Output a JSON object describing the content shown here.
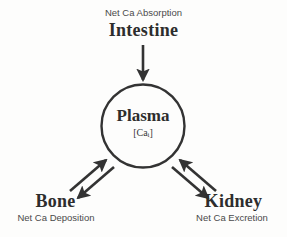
{
  "diagram": {
    "stroke_color": "#333333",
    "background_color": "#fdfdfc",
    "text_color": "#2d2d2d"
  },
  "nodes": {
    "intestine": {
      "title": "Intestine",
      "caption": "Net Ca Absorption"
    },
    "plasma": {
      "title": "Plasma",
      "value_open": "[Ca",
      "value_subscript": "i",
      "value_close": "]"
    },
    "bone": {
      "title": "Bone",
      "caption": "Net Ca Deposition"
    },
    "kidney": {
      "title": "Kidney",
      "caption": "Net Ca Excretion"
    }
  },
  "arrows": [
    {
      "name": "intestine-to-plasma",
      "from": "Intestine",
      "to": "Plasma",
      "direction": "one-way-down"
    },
    {
      "name": "bone-to-plasma",
      "from": "Bone",
      "to": "Plasma",
      "direction": "up-right"
    },
    {
      "name": "plasma-to-bone",
      "from": "Plasma",
      "to": "Bone",
      "direction": "down-left"
    },
    {
      "name": "kidney-to-plasma",
      "from": "Kidney",
      "to": "Plasma",
      "direction": "up-left"
    },
    {
      "name": "plasma-to-kidney",
      "from": "Plasma",
      "to": "Kidney",
      "direction": "down-right"
    }
  ]
}
